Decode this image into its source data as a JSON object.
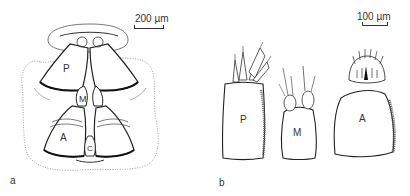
{
  "figure": {
    "panels": [
      {
        "id": "a",
        "panel_label": "a",
        "scale_bar": {
          "text": "200 µm"
        },
        "part_labels": {
          "P": "P",
          "M": "M",
          "A": "A",
          "C": "C"
        }
      },
      {
        "id": "b",
        "panel_label": "b",
        "scale_bar": {
          "text": "100 µm"
        },
        "part_labels": {
          "P": "P",
          "M": "M",
          "A": "A"
        }
      }
    ]
  }
}
